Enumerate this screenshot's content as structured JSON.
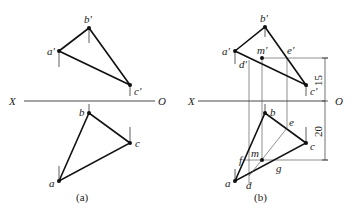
{
  "figure_a": {
    "caption": "(a)",
    "axis": {
      "left_label": "X",
      "right_label": "O"
    },
    "front_view_labels": {
      "a": "a'",
      "b": "b'",
      "c": "c'"
    },
    "top_view_labels": {
      "a": "a",
      "b": "b",
      "c": "c"
    }
  },
  "figure_b": {
    "caption": "(b)",
    "axis": {
      "left_label": "X",
      "right_label": "O"
    },
    "front_view_labels": {
      "a": "a'",
      "b": "b'",
      "c": "c'",
      "m": "m'",
      "d": "d'",
      "e": "e'"
    },
    "top_view_labels": {
      "a": "a",
      "b": "b",
      "c": "c",
      "m": "m",
      "d": "d",
      "e": "e",
      "f": "f",
      "g": "g"
    },
    "dimensions": {
      "upper": "15",
      "lower": "20"
    }
  }
}
